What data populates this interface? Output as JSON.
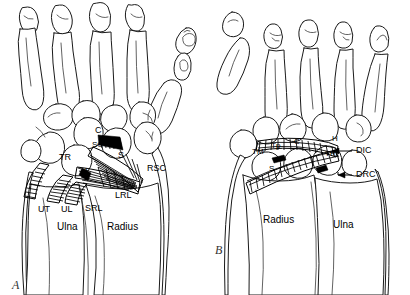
{
  "figure": {
    "type": "anatomical-line-drawing",
    "background_color": "#ffffff",
    "ink_color": "#000000",
    "panel_count": 2
  },
  "panels": [
    {
      "id": "A",
      "caption": "A",
      "view": "volar",
      "caption_position": {
        "x": 12,
        "y": 278
      },
      "bones": [
        {
          "key": "TR",
          "label": "TR",
          "name": "triquetrum",
          "x": 59,
          "y": 153,
          "size": "md"
        },
        {
          "key": "L",
          "label": "L",
          "name": "lunate",
          "x": 85,
          "y": 167,
          "size": "md"
        },
        {
          "key": "C",
          "label": "C",
          "name": "capitate",
          "x": 95,
          "y": 126,
          "size": "md"
        },
        {
          "key": "S",
          "label": "S",
          "name": "scaphoid",
          "x": 118,
          "y": 151,
          "size": "md"
        }
      ],
      "ligaments": [
        {
          "key": "SC",
          "label": "SC",
          "name": "scaphocapitate ligament",
          "x": 92,
          "y": 141,
          "size": "sm"
        },
        {
          "key": "RSC",
          "label": "RSC",
          "name": "radioscaphocapitate ligament",
          "x": 147,
          "y": 164,
          "size": "md"
        },
        {
          "key": "LRL",
          "label": "LRL",
          "name": "long radiolunate ligament",
          "x": 115,
          "y": 191,
          "size": "md"
        },
        {
          "key": "SRL",
          "label": "SRL",
          "name": "short radiolunate ligament",
          "x": 85,
          "y": 204,
          "size": "md"
        },
        {
          "key": "UL",
          "label": "UL",
          "name": "ulnolunate ligament",
          "x": 61,
          "y": 205,
          "size": "md"
        },
        {
          "key": "UT",
          "label": "UT",
          "name": "ulnotriquetral ligament",
          "x": 38,
          "y": 205,
          "size": "md"
        }
      ],
      "forearm_bones": [
        {
          "key": "Ulna",
          "label": "Ulna",
          "x": 57,
          "y": 222,
          "size": "lg"
        },
        {
          "key": "Radius",
          "label": "Radius",
          "x": 107,
          "y": 222,
          "size": "lg"
        }
      ]
    },
    {
      "id": "B",
      "caption": "B",
      "view": "dorsal",
      "caption_position": {
        "x": 215,
        "y": 243
      },
      "bones": [
        {
          "key": "TM",
          "label": "TM",
          "name": "trapezium",
          "x": 252,
          "y": 148,
          "size": "sm"
        },
        {
          "key": "Tp",
          "label": "Tp",
          "name": "trapezoid",
          "x": 271,
          "y": 142,
          "size": "sm"
        },
        {
          "key": "C",
          "label": "C",
          "name": "capitate",
          "x": 294,
          "y": 138,
          "size": "sm"
        },
        {
          "key": "H",
          "label": "H",
          "name": "hamate",
          "x": 332,
          "y": 135,
          "size": "sm"
        },
        {
          "key": "TR",
          "label": "TR",
          "name": "triquetrum",
          "x": 325,
          "y": 150,
          "size": "sm"
        },
        {
          "key": "S",
          "label": "S",
          "name": "scaphoid",
          "x": 269,
          "y": 165,
          "size": "sm"
        }
      ],
      "ligaments": [
        {
          "key": "DIC",
          "label": "DIC",
          "name": "dorsal intercarpal ligament",
          "x": 356,
          "y": 151,
          "size": "md"
        },
        {
          "key": "DRC",
          "label": "DRC",
          "name": "dorsal radiocarpal ligament",
          "x": 356,
          "y": 176,
          "size": "md"
        }
      ],
      "forearm_bones": [
        {
          "key": "Radius",
          "label": "Radius",
          "x": 263,
          "y": 215,
          "size": "lg"
        },
        {
          "key": "Ulna",
          "label": "Ulna",
          "x": 333,
          "y": 220,
          "size": "lg"
        }
      ]
    }
  ]
}
